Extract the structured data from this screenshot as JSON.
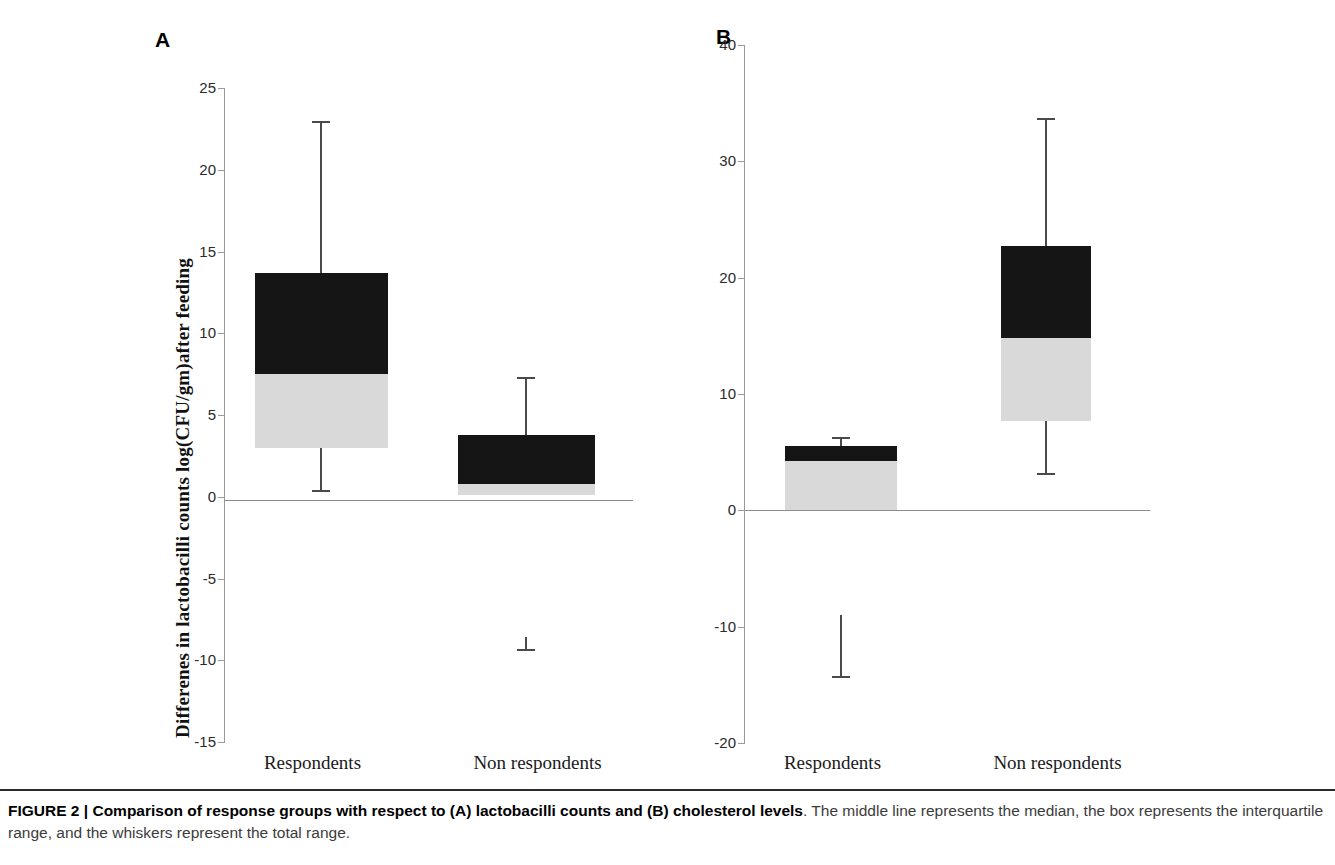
{
  "figure": {
    "label": "FIGURE 2",
    "separator": "|",
    "title_bold": "Comparison of response groups with respect to (A) lactobacilli counts and (B) cholesterol levels",
    "body": ". The middle line represents the median, the box represents the interquartile range, and the whiskers represent the total range."
  },
  "panels": [
    {
      "letter": "A",
      "ylabel": "Differenes in lactobacilli  counts  log(CFU/gm)after  feeding",
      "yticks": [
        "25",
        "20",
        "15",
        "10",
        "5",
        "0",
        "-5",
        "-10",
        "-15"
      ],
      "categories": [
        "Respondents",
        "Non respondents"
      ]
    },
    {
      "letter": "B",
      "ylabel": "Differencees in cholesterol levels (mg/dL)  after feeding",
      "yticks": [
        "40",
        "30",
        "20",
        "10",
        "0",
        "-10",
        "-20"
      ],
      "categories": [
        "Respondents",
        "Non respondents"
      ]
    }
  ],
  "chart_data": [
    {
      "type": "box",
      "panel": "A",
      "title": "Differenes in lactobacilli counts log(CFU/gm) after feeding",
      "xlabel": "",
      "ylabel": "Differenes in lactobacilli  counts  log(CFU/gm)after  feeding",
      "ylim": [
        -15,
        25
      ],
      "ytick_values": [
        25,
        20,
        15,
        10,
        5,
        0,
        -5,
        -10,
        -15
      ],
      "grid": false,
      "legend": "none",
      "categories": [
        "Respondents",
        "Non respondents"
      ],
      "boxes": [
        {
          "category": "Respondents",
          "whisker_low": 0.4,
          "q1": 3.0,
          "median": 7.5,
          "q3": 13.7,
          "whisker_high": 23.0
        },
        {
          "category": "Non respondents",
          "whisker_low": -9.3,
          "whisker_low_upper": -8.6,
          "q1": 0.1,
          "median": 0.8,
          "q3": 3.8,
          "whisker_high": 7.3
        }
      ]
    },
    {
      "type": "box",
      "panel": "B",
      "title": "Differencees in cholesterol levels (mg/dL) after feeding",
      "xlabel": "",
      "ylabel": "Differencees in cholesterol levels (mg/dL)  after feeding",
      "ylim": [
        -20,
        40
      ],
      "ytick_values": [
        40,
        30,
        20,
        10,
        0,
        -10,
        -20
      ],
      "grid": false,
      "legend": "none",
      "categories": [
        "Respondents",
        "Non respondents"
      ],
      "boxes": [
        {
          "category": "Respondents",
          "whisker_low": -14.2,
          "whisker_low_upper": -9.0,
          "q1": 0.0,
          "median": 4.2,
          "q3": 5.5,
          "whisker_high": 6.3
        },
        {
          "category": "Non respondents",
          "whisker_low": 3.2,
          "q1": 7.7,
          "median": 14.8,
          "q3": 22.7,
          "whisker_high": 33.7
        }
      ]
    }
  ],
  "colors": {
    "box_upper": "#151515",
    "box_lower": "#d9d9d9",
    "whisker": "#4a4a4a",
    "axis": "#9a9a9a",
    "text": "#1a1a1a"
  }
}
